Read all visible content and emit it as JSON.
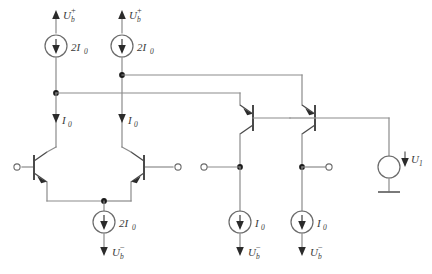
{
  "diagram": {
    "type": "electronic-schematic",
    "canvas": {
      "width": 432,
      "height": 274
    },
    "colors": {
      "background": "#ffffff",
      "wire": "#8b8b8b",
      "device": "#4a4a4a",
      "node": "#1a1a1a",
      "label": "#3a3a3a"
    }
  },
  "labels": {
    "supply_pos_1": {
      "base": "U",
      "sub": "b",
      "sup": "+"
    },
    "supply_pos_2": {
      "base": "U",
      "sub": "b",
      "sup": "+"
    },
    "supply_neg_1": {
      "base": "U",
      "sub": "b",
      "sup": "−"
    },
    "supply_neg_2": {
      "base": "U",
      "sub": "b",
      "sup": "−"
    },
    "supply_neg_3": {
      "base": "U",
      "sub": "b",
      "sup": "−"
    },
    "current_2i0_top_left": {
      "base": "2I",
      "sub": "0"
    },
    "current_2i0_top_right": {
      "base": "2I",
      "sub": "0"
    },
    "current_i0_mid_left": {
      "base": "I",
      "sub": "0"
    },
    "current_i0_mid_right": {
      "base": "I",
      "sub": "0"
    },
    "current_2i0_tail": {
      "base": "2I",
      "sub": "0"
    },
    "current_i0_bottom_left": {
      "base": "I",
      "sub": "0"
    },
    "current_i0_bottom_right": {
      "base": "I",
      "sub": "0"
    },
    "voltage_source_u1": {
      "base": "U",
      "sub": "1"
    }
  },
  "components": {
    "current_sources": [
      {
        "id": "cs-top-left",
        "label_key": "current_2i0_top_left",
        "direction": "down",
        "cx": 56,
        "cy": 46
      },
      {
        "id": "cs-top-right",
        "label_key": "current_2i0_top_right",
        "direction": "down",
        "cx": 122,
        "cy": 46
      },
      {
        "id": "cs-tail",
        "label_key": "current_2i0_tail",
        "direction": "down",
        "cx": 104,
        "cy": 222
      },
      {
        "id": "cs-bottom-left",
        "label_key": "current_i0_bottom_left",
        "direction": "down",
        "cx": 240,
        "cy": 222
      },
      {
        "id": "cs-bottom-right",
        "label_key": "current_i0_bottom_right",
        "direction": "down",
        "cx": 302,
        "cy": 222
      }
    ],
    "transistors": [
      {
        "id": "q1",
        "kind": "npn",
        "orientation": "right",
        "note": "left input device of differential pair"
      },
      {
        "id": "q2",
        "kind": "npn",
        "orientation": "left",
        "note": "right input device of differential pair"
      },
      {
        "id": "q3",
        "kind": "pnp",
        "orientation": "right",
        "note": "first output follower"
      },
      {
        "id": "q4",
        "kind": "pnp",
        "orientation": "right",
        "note": "second output follower"
      }
    ],
    "voltage_source": {
      "id": "v1",
      "label_key": "voltage_source_u1",
      "cx": 389,
      "cy": 167,
      "grounded": true
    },
    "terminals": [
      {
        "id": "in-minus",
        "x": 17,
        "y": 167,
        "side": "left"
      },
      {
        "id": "in-plus",
        "x": 178,
        "y": 167,
        "side": "right"
      },
      {
        "id": "mid-node",
        "x": 207,
        "y": 167,
        "side": "left"
      },
      {
        "id": "out-node",
        "x": 331,
        "y": 167,
        "side": "right"
      }
    ]
  }
}
